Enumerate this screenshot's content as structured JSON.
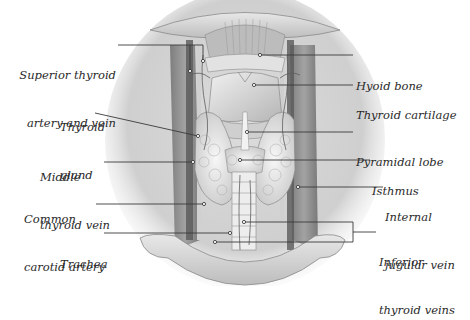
{
  "diagram": {
    "type": "anatomical-illustration",
    "labels_left": [
      {
        "id": "superior-thyroid",
        "line1": "Superior thyroid",
        "line2": "artery and vein"
      },
      {
        "id": "thyroid-gland",
        "line1": "Thyroid",
        "line2": "gland"
      },
      {
        "id": "middle-thyroid-vein",
        "line1": "Middle",
        "line2": "thyroid vein"
      },
      {
        "id": "common-carotid",
        "line1": "Common",
        "line2": "carotid artery"
      },
      {
        "id": "trachea",
        "line1": "Trachea",
        "line2": ""
      }
    ],
    "labels_right": [
      {
        "id": "hyoid-bone",
        "line1": "Hyoid bone",
        "line2": ""
      },
      {
        "id": "thyroid-cartilage",
        "line1": "Thyroid cartilage",
        "line2": ""
      },
      {
        "id": "pyramidal-lobe",
        "line1": "Pyramidal lobe",
        "line2": ""
      },
      {
        "id": "isthmus",
        "line1": "Isthmus",
        "line2": ""
      },
      {
        "id": "internal-jugular",
        "line1": "Internal",
        "line2": "jugular vein"
      },
      {
        "id": "inferior-thyroid-veins",
        "line1": "Inferior",
        "line2": "thyroid veins"
      }
    ],
    "colors": {
      "background": "#ffffff",
      "text": "#2a2a2a",
      "leader_line": "#3a3a3a",
      "tissue_light": "#e4e4e4",
      "tissue_mid": "#b8b8b8",
      "tissue_dark": "#7a7a7a"
    }
  }
}
